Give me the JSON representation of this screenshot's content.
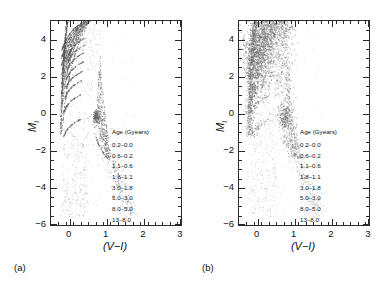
{
  "figure": {
    "panels": [
      {
        "tag": "(a)",
        "name": "theoretical-isochrone-cmd",
        "legend": {
          "title": "Age (Gyears)",
          "entries": [
            "0.2–0.0",
            "0.6–0.2",
            "1.1–0.6",
            "1.8–1.1",
            "3.0–1.8",
            "5.0–3.0",
            "8.0–5.0",
            "13–8.0"
          ]
        }
      },
      {
        "tag": "(b)",
        "name": "observed-scatter-cmd",
        "legend": {
          "title": "Age (Gyears)",
          "entries": [
            "0.2–0.0",
            "0.6–0.2",
            "1.1–0.6",
            "1.8–1.1",
            "3.0–1.8",
            "5.0–3.0",
            "8.0–5.0",
            "13–8.0"
          ]
        }
      }
    ]
  },
  "chart_data": [
    {
      "type": "scatter",
      "panel": "(a)",
      "title": "",
      "xlabel": "(V−I)",
      "ylabel": "M_I",
      "xlim": [
        -0.5,
        3.0
      ],
      "ylim": [
        5.0,
        -6.0
      ],
      "y_inverted": true,
      "xticks": [
        0,
        1,
        2,
        3
      ],
      "yticks": [
        -6,
        -4,
        -2,
        0,
        2,
        4
      ],
      "xtick_labels": [
        "0",
        "1",
        "2",
        "3"
      ],
      "ytick_labels": [
        "−6",
        "−4",
        "−2",
        "0",
        "2",
        "4"
      ],
      "x_minor_tick_step": 0.2,
      "y_minor_tick_step": 0.5,
      "grid": false,
      "legend_position": "inside-right-middle",
      "legend_title": "Age (Gyears)",
      "series": [
        {
          "name": "0.2–0.0",
          "color": "#555555",
          "n_points": 900
        },
        {
          "name": "0.6–0.2",
          "color": "#555555",
          "n_points": 900
        },
        {
          "name": "1.1–0.6",
          "color": "#555555",
          "n_points": 900
        },
        {
          "name": "1.8–1.1",
          "color": "#555555",
          "n_points": 900
        },
        {
          "name": "3.0–1.8",
          "color": "#555555",
          "n_points": 900
        },
        {
          "name": "5.0–3.0",
          "color": "#555555",
          "n_points": 900
        },
        {
          "name": "8.0–5.0",
          "color": "#555555",
          "n_points": 900
        },
        {
          "name": "13–8.0",
          "color": "#555555",
          "n_points": 900
        }
      ],
      "features": [
        {
          "feature": "main-sequence",
          "x_range": [
            -0.25,
            0.1
          ],
          "y_range": [
            -1.0,
            5.0
          ],
          "density": "high"
        },
        {
          "feature": "subgiant-turnoff-fan",
          "x_range": [
            0.1,
            0.9
          ],
          "y_range": [
            1.0,
            4.5
          ],
          "density": "high"
        },
        {
          "feature": "red-giant-branch",
          "x_range": [
            0.75,
            1.1
          ],
          "y_range": [
            -2.0,
            4.0
          ],
          "density": "high"
        },
        {
          "feature": "bright-blue-plume",
          "x_range": [
            0.2,
            0.8
          ],
          "y_range": [
            -5.5,
            0.5
          ],
          "density": "low"
        },
        {
          "feature": "supergiant-plume",
          "x_range": [
            0.8,
            1.8
          ],
          "y_range": [
            -5.0,
            -1.0
          ],
          "density": "low"
        },
        {
          "feature": "red-clump",
          "x_range": [
            0.55,
            0.9
          ],
          "y_range": [
            -0.6,
            0.2
          ],
          "density": "medium"
        }
      ],
      "noise_applied": false
    },
    {
      "type": "scatter",
      "panel": "(b)",
      "title": "",
      "xlabel": "(V−I)",
      "ylabel": "M_I",
      "xlim": [
        -0.5,
        3.0
      ],
      "ylim": [
        5.0,
        -6.0
      ],
      "y_inverted": true,
      "xticks": [
        0,
        1,
        2,
        3
      ],
      "yticks": [
        -6,
        -4,
        -2,
        0,
        2,
        4
      ],
      "xtick_labels": [
        "0",
        "1",
        "2",
        "3"
      ],
      "ytick_labels": [
        "−6",
        "−4",
        "−2",
        "0",
        "2",
        "4"
      ],
      "x_minor_tick_step": 0.2,
      "y_minor_tick_step": 0.5,
      "grid": false,
      "legend_position": "inside-right-middle",
      "legend_title": "Age (Gyears)",
      "series": [
        {
          "name": "0.2–0.0",
          "color": "#6a6a6a",
          "n_points": 900
        },
        {
          "name": "0.6–0.2",
          "color": "#6a6a6a",
          "n_points": 900
        },
        {
          "name": "1.1–0.6",
          "color": "#6a6a6a",
          "n_points": 900
        },
        {
          "name": "1.8–1.1",
          "color": "#6a6a6a",
          "n_points": 900
        },
        {
          "name": "3.0–1.8",
          "color": "#6a6a6a",
          "n_points": 900
        },
        {
          "name": "5.0–3.0",
          "color": "#6a6a6a",
          "n_points": 900
        },
        {
          "name": "8.0–5.0",
          "color": "#6a6a6a",
          "n_points": 900
        },
        {
          "name": "13–8.0",
          "color": "#6a6a6a",
          "n_points": 900
        }
      ],
      "features": [
        {
          "feature": "main-sequence",
          "x_range": [
            -0.3,
            0.15
          ],
          "y_range": [
            -1.5,
            5.0
          ],
          "density": "high"
        },
        {
          "feature": "blurred-subgiant-cloud",
          "x_range": [
            0.0,
            1.0
          ],
          "y_range": [
            1.0,
            4.8
          ],
          "density": "high"
        },
        {
          "feature": "red-giant-branch",
          "x_range": [
            0.7,
            1.15
          ],
          "y_range": [
            -2.0,
            4.0
          ],
          "density": "medium"
        },
        {
          "feature": "bright-blue-plume",
          "x_range": [
            0.1,
            0.8
          ],
          "y_range": [
            -5.5,
            0.5
          ],
          "density": "low"
        },
        {
          "feature": "supergiant-plume",
          "x_range": [
            0.8,
            1.8
          ],
          "y_range": [
            -5.0,
            -1.0
          ],
          "density": "low"
        },
        {
          "feature": "red-clump",
          "x_range": [
            0.5,
            0.95
          ],
          "y_range": [
            -0.6,
            0.3
          ],
          "density": "medium"
        }
      ],
      "noise_applied": true
    }
  ]
}
